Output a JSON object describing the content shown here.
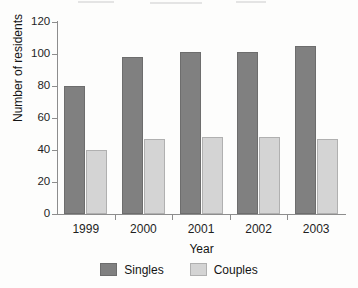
{
  "chart_data": {
    "type": "bar",
    "title": "",
    "xlabel": "Year",
    "ylabel": "Number of residents",
    "categories": [
      "1999",
      "2000",
      "2001",
      "2002",
      "2003"
    ],
    "series": [
      {
        "name": "Singles",
        "color": "#808080",
        "values": [
          80,
          98,
          101,
          101,
          105
        ]
      },
      {
        "name": "Couples",
        "color": "#d4d4d4",
        "values": [
          40,
          47,
          48,
          48,
          47
        ]
      }
    ],
    "ylim": [
      0,
      120
    ],
    "ytick_values": [
      0,
      20,
      40,
      60,
      80,
      100,
      120
    ],
    "ytick_labels": [
      "0",
      "20",
      "40",
      "60",
      "80",
      "100",
      "120"
    ],
    "grid": false,
    "legend_position": "bottom-center",
    "axis_color": "#8d8d8d",
    "background": "#fdfdfc"
  },
  "legend": {
    "items": [
      {
        "label": "Singles",
        "swatch": "singles-swatch"
      },
      {
        "label": "Couples",
        "swatch": "couples-swatch"
      }
    ]
  }
}
